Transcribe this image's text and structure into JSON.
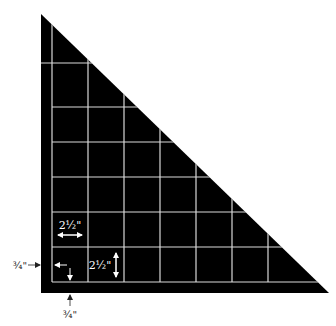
{
  "diagram": {
    "colors": {
      "background": "#ffffff",
      "fabric": "#000000",
      "grid_lines": "#d9d9d9",
      "annotation_white": "#ffffff",
      "annotation_black": "#222222"
    },
    "triangle": {
      "top_vertex": [
        41,
        14
      ],
      "bottom_left": [
        41,
        293
      ],
      "bottom_right": [
        329,
        293
      ]
    },
    "grid": {
      "vertical_x": [
        52,
        88,
        124,
        160,
        196,
        232,
        268
      ],
      "horizontal_y": [
        63,
        107,
        142,
        177,
        212,
        247,
        282
      ],
      "square_size_label": "2½\""
    },
    "annotations": {
      "horizontal_square_label": "2½\"",
      "vertical_square_label": "2½\"",
      "left_seam_label": "¾\"",
      "bottom_seam_label": "¾\""
    }
  }
}
